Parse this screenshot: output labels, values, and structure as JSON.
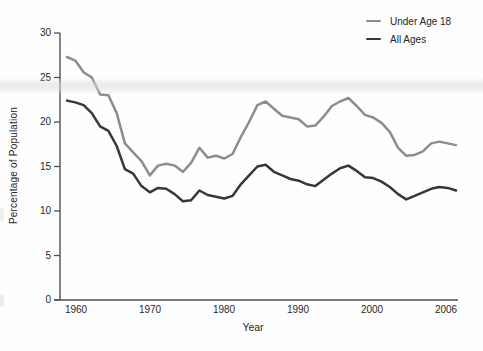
{
  "colors": {
    "background": "#fefefe",
    "axis": "#4f4f4f",
    "text": "#29272a",
    "under18_line": "#8d8d8d",
    "all_ages_line": "#373737",
    "scan_band": "#dcdcdc"
  },
  "legend": {
    "items": [
      {
        "label": "Under Age 18"
      },
      {
        "label": "All Ages"
      }
    ]
  },
  "chart_data": {
    "type": "line",
    "title": "",
    "xlabel": "Year",
    "ylabel": "Percentage of Population",
    "xlim": [
      1959,
      2006
    ],
    "ylim": [
      0,
      30
    ],
    "grid": false,
    "legend_position": "top-right",
    "y_ticks": [
      0,
      5,
      10,
      15,
      20,
      25,
      30
    ],
    "x_tick_labels": [
      "1960",
      "1970",
      "1980",
      "1990",
      "2000",
      "2006"
    ],
    "x": [
      1959,
      1960,
      1961,
      1962,
      1963,
      1964,
      1965,
      1966,
      1967,
      1968,
      1969,
      1970,
      1971,
      1972,
      1973,
      1974,
      1975,
      1976,
      1977,
      1978,
      1979,
      1980,
      1981,
      1982,
      1983,
      1984,
      1985,
      1986,
      1987,
      1988,
      1989,
      1990,
      1991,
      1992,
      1993,
      1994,
      1995,
      1996,
      1997,
      1998,
      1999,
      2000,
      2001,
      2002,
      2003,
      2004,
      2005,
      2006
    ],
    "series": [
      {
        "name": "Under Age 18",
        "color": "#8d8d8d",
        "values": [
          27.3,
          26.9,
          25.6,
          25.0,
          23.1,
          23.0,
          21.0,
          17.6,
          16.6,
          15.6,
          14.0,
          15.1,
          15.3,
          15.1,
          14.4,
          15.4,
          17.1,
          16.0,
          16.2,
          15.9,
          16.4,
          18.3,
          20.0,
          21.9,
          22.3,
          21.5,
          20.7,
          20.5,
          20.3,
          19.5,
          19.6,
          20.6,
          21.8,
          22.3,
          22.7,
          21.8,
          20.8,
          20.5,
          19.9,
          18.9,
          17.1,
          16.2,
          16.3,
          16.7,
          17.6,
          17.8,
          17.6,
          17.4
        ]
      },
      {
        "name": "All Ages",
        "color": "#373737",
        "values": [
          22.4,
          22.2,
          21.9,
          21.0,
          19.5,
          19.0,
          17.3,
          14.7,
          14.2,
          12.8,
          12.1,
          12.6,
          12.5,
          11.9,
          11.1,
          11.2,
          12.3,
          11.8,
          11.6,
          11.4,
          11.7,
          13.0,
          14.0,
          15.0,
          15.2,
          14.4,
          14.0,
          13.6,
          13.4,
          13.0,
          12.8,
          13.5,
          14.2,
          14.8,
          15.1,
          14.5,
          13.8,
          13.7,
          13.3,
          12.7,
          11.9,
          11.3,
          11.7,
          12.1,
          12.5,
          12.7,
          12.6,
          12.3
        ]
      }
    ]
  }
}
